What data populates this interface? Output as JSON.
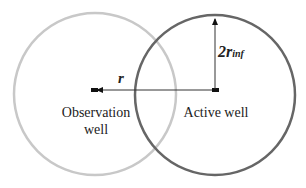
{
  "diagram": {
    "observation_circle": {
      "cx": 95,
      "cy": 94,
      "r": 81,
      "stroke": "#c8c8c8"
    },
    "active_circle": {
      "cx": 215,
      "cy": 95,
      "r": 80,
      "stroke": "#666666"
    },
    "distance_arrow": {
      "label": "r"
    },
    "radius_arrow": {
      "label_main": "2r",
      "label_sub": "inf"
    },
    "observation_well": {
      "line1": "Observation",
      "line2": "well"
    },
    "active_well": {
      "label": "Active well"
    }
  }
}
